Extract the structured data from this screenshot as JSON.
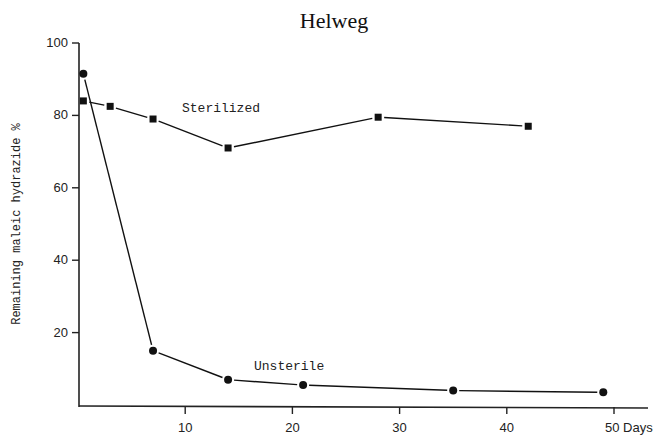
{
  "chart_data": {
    "type": "line",
    "title": "Helweg",
    "xlabel": "Days",
    "ylabel": "Remaining maleic hydrazide %",
    "xlim": [
      0,
      53
    ],
    "ylim": [
      0,
      100
    ],
    "x_ticks": [
      10,
      20,
      30,
      40,
      50
    ],
    "x_tick_labels": [
      "10",
      "20",
      "30",
      "40",
      "50 Days"
    ],
    "y_ticks": [
      20,
      40,
      60,
      80,
      100
    ],
    "y_tick_labels": [
      "20",
      "40",
      "60",
      "80",
      "100"
    ],
    "grid": false,
    "legend": "inline labels",
    "series": [
      {
        "name": "Sterilized",
        "marker": "square",
        "color": "#111111",
        "x": [
          0.5,
          3,
          7,
          14,
          28,
          42
        ],
        "values": [
          84,
          82.5,
          79,
          71,
          79.5,
          77
        ]
      },
      {
        "name": "Unsterile",
        "marker": "circle",
        "color": "#111111",
        "x": [
          0.5,
          7,
          14,
          21,
          35,
          49
        ],
        "values": [
          91.5,
          15,
          7,
          5.5,
          4,
          3.5
        ]
      }
    ],
    "annotations": [
      {
        "text": "Sterilized",
        "x": 14.5,
        "y": 82
      },
      {
        "text": "Unsterile",
        "x": 21,
        "y": 10
      }
    ]
  }
}
